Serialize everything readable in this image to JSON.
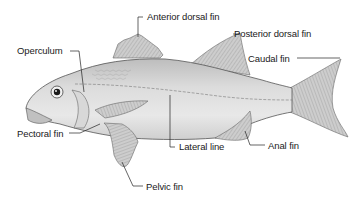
{
  "diagram": {
    "labels": {
      "anterior_dorsal_fin": "Anterior dorsal fin",
      "posterior_dorsal_fin": "Posterior dorsal fin",
      "operculum": "Operculum",
      "caudal_fin": "Caudal fin",
      "pectoral_fin": "Pectoral fin",
      "lateral_line": "Lateral line",
      "anal_fin": "Anal fin",
      "pelvic_fin": "Pelvic fin"
    },
    "colors": {
      "body": "#d2d2d2",
      "body_light": "#e6e6e6",
      "fin": "#c4c4c4",
      "outline": "#555555",
      "leader": "#222222",
      "text": "#1a1a1a"
    }
  }
}
